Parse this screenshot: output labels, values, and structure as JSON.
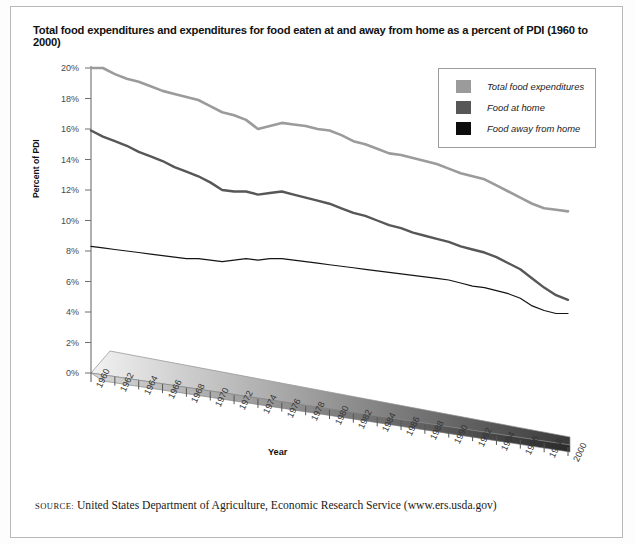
{
  "title": "Total food expenditures and expenditures for food eaten at and away from home as a percent of PDI (1960 to 2000)",
  "source": {
    "label": "SOURCE:",
    "text": "United States Department of Agriculture, Economic Research Service (www.ers.usda.gov)"
  },
  "legend": {
    "position": "top-right",
    "items": [
      {
        "label": "Total food expenditures",
        "color": "#9b9b9b"
      },
      {
        "label": "Food at home",
        "color": "#575757"
      },
      {
        "label": "Food away from home",
        "color": "#0d0d0d"
      }
    ]
  },
  "colors": {
    "total": "#9b9b9b",
    "at_home": "#575757",
    "away": "#141414",
    "axis": "#6f6f6f",
    "frame": "#b8b8b8"
  },
  "chart_data": {
    "type": "line",
    "title": "Total food expenditures and expenditures for food eaten at and away from home as a percent of PDI (1960 to 2000)",
    "xlabel": "Year",
    "ylabel": "Percent of PDI",
    "ylim": [
      0,
      20
    ],
    "ytick_labels": [
      "0%",
      "2%",
      "4%",
      "6%",
      "8%",
      "10%",
      "12%",
      "14%",
      "16%",
      "18%",
      "20%"
    ],
    "ytick_values": [
      0,
      2,
      4,
      6,
      8,
      10,
      12,
      14,
      16,
      18,
      20
    ],
    "grid": false,
    "xlim": [
      1960,
      2000
    ],
    "x": [
      1960,
      1961,
      1962,
      1963,
      1964,
      1965,
      1966,
      1967,
      1968,
      1969,
      1970,
      1971,
      1972,
      1973,
      1974,
      1975,
      1976,
      1977,
      1978,
      1979,
      1980,
      1981,
      1982,
      1983,
      1984,
      1985,
      1986,
      1987,
      1988,
      1989,
      1990,
      1991,
      1992,
      1993,
      1994,
      1995,
      1996,
      1997,
      1998,
      1999,
      2000
    ],
    "xtick_labels": [
      "1960",
      "1962",
      "1964",
      "1966",
      "1968",
      "1970",
      "1972",
      "1974",
      "1976",
      "1978",
      "1980",
      "1982",
      "1984",
      "1986",
      "1988",
      "1990",
      "1992",
      "1994",
      "1996",
      "1998",
      "2000"
    ],
    "series": [
      {
        "name": "Total food expenditures",
        "color": "#9b9b9b",
        "values": [
          20.0,
          20.0,
          19.6,
          19.3,
          19.1,
          18.8,
          18.5,
          18.3,
          18.1,
          17.9,
          17.5,
          17.1,
          16.9,
          16.6,
          16.0,
          16.2,
          16.4,
          16.3,
          16.2,
          16.0,
          15.9,
          15.6,
          15.2,
          15.0,
          14.7,
          14.4,
          14.3,
          14.1,
          13.9,
          13.7,
          13.4,
          13.1,
          12.9,
          12.7,
          12.3,
          11.9,
          11.5,
          11.1,
          10.8,
          10.7,
          10.6
        ]
      },
      {
        "name": "Food at home",
        "color": "#575757",
        "values": [
          15.9,
          15.5,
          15.2,
          14.9,
          14.5,
          14.2,
          13.9,
          13.5,
          13.2,
          12.9,
          12.5,
          12.0,
          11.9,
          11.9,
          11.7,
          11.8,
          11.9,
          11.7,
          11.5,
          11.3,
          11.1,
          10.8,
          10.5,
          10.3,
          10.0,
          9.7,
          9.5,
          9.2,
          9.0,
          8.8,
          8.6,
          8.3,
          8.1,
          7.9,
          7.6,
          7.2,
          6.8,
          6.2,
          5.6,
          5.1,
          4.8
        ]
      },
      {
        "name": "Food away from home",
        "color": "#141414",
        "values": [
          8.3,
          8.2,
          8.1,
          8.0,
          7.9,
          7.8,
          7.7,
          7.6,
          7.5,
          7.5,
          7.4,
          7.3,
          7.4,
          7.5,
          7.4,
          7.5,
          7.5,
          7.4,
          7.3,
          7.2,
          7.1,
          7.0,
          6.9,
          6.8,
          6.7,
          6.6,
          6.5,
          6.4,
          6.3,
          6.2,
          6.1,
          5.9,
          5.7,
          5.6,
          5.4,
          5.2,
          4.9,
          4.4,
          4.1,
          3.9,
          3.9
        ]
      }
    ],
    "decoration": {
      "name": "gradient-band",
      "from_color": "#f2f2f2",
      "to_color": "#3a3a3a"
    }
  }
}
